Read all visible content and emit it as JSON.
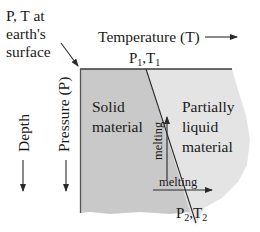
{
  "diagram": {
    "surface_label_line1": "P, T at",
    "surface_label_line2": "earth's",
    "surface_label_line3": "surface",
    "x_axis_label": "Temperature (T)",
    "y_axis_label": "Pressure (P)",
    "depth_label": "Depth",
    "point1": {
      "p": "P",
      "p_sub": "1",
      "sep": ",",
      "t": "T",
      "t_sub": "1"
    },
    "point2": {
      "p": "P",
      "p_sub": "2",
      "sep": ",",
      "t": "T",
      "t_sub": "2"
    },
    "solid_region": {
      "line1": "Solid",
      "line2": "material"
    },
    "liquid_region": {
      "line1": "Partially",
      "line2": "liquid",
      "line3": "material"
    },
    "melting_vertical": "melting",
    "melting_horizontal": "melting",
    "colors": {
      "solid_fill": "#c9c9c9",
      "liquid_fill": "#e4e4e4",
      "lines": "#2a2a2a",
      "text": "#1a1a1a"
    }
  }
}
